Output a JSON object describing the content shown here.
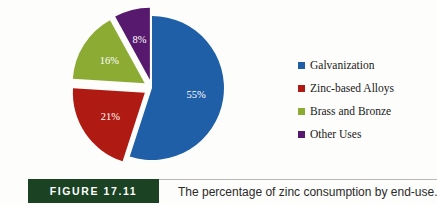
{
  "figure": {
    "tag": "FIGURE 17.11",
    "caption": "The percentage of zinc consumption by end-use.",
    "tag_background": "#1a4223"
  },
  "legend": {
    "position": "right",
    "items": [
      {
        "label": "Galvanization",
        "color": "#1f5fa8",
        "swatch": "legend-swatch-galvanization"
      },
      {
        "label": "Zinc-based Alloys",
        "color": "#af1b13",
        "swatch": "legend-swatch-zinc-based-alloys"
      },
      {
        "label": "Brass and Bronze",
        "color": "#8cab33",
        "swatch": "legend-swatch-brass-and-bronze"
      },
      {
        "label": "Other Uses",
        "color": "#57196e",
        "swatch": "legend-swatch-other-uses"
      }
    ]
  },
  "chart_data": {
    "type": "pie",
    "title": "",
    "subtitle": "",
    "xlabel": "",
    "ylabel": "",
    "grid": false,
    "exploded": true,
    "start_angle_deg": -90,
    "direction": "clockwise",
    "unit": "%",
    "categories": [
      "Galvanization",
      "Zinc-based Alloys",
      "Brass and Bronze",
      "Other Uses"
    ],
    "values": [
      55,
      21,
      16,
      8
    ],
    "colors": [
      "#1f5fa8",
      "#af1b13",
      "#8cab33",
      "#57196e"
    ],
    "data_labels": [
      "55%",
      "21%",
      "16%",
      "8%"
    ],
    "data_label_color": "#ffffff",
    "total": 100,
    "slices": [
      {
        "name": "Galvanization",
        "value": 55,
        "label": "55%",
        "color": "#1f5fa8",
        "explode": 0.0
      },
      {
        "name": "Zinc-based Alloys",
        "value": 21,
        "label": "21%",
        "color": "#af1b13",
        "explode": 0.12
      },
      {
        "name": "Brass and Bronze",
        "value": 16,
        "label": "16%",
        "color": "#8cab33",
        "explode": 0.12
      },
      {
        "name": "Other Uses",
        "value": 8,
        "label": "8%",
        "color": "#57196e",
        "explode": 0.12
      }
    ]
  }
}
